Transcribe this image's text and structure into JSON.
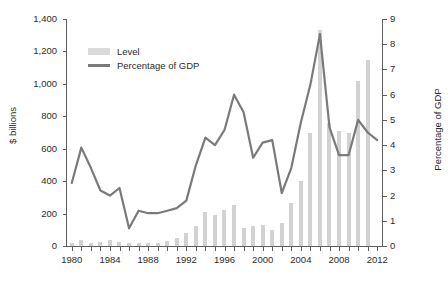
{
  "chart_data": {
    "type": "bar",
    "title": "",
    "subtitle": "",
    "xlabel": "",
    "ylabel": "$ billions",
    "y2label": "Percentage of GDP",
    "xlim": [
      1979.5,
      2012.5
    ],
    "ylim": [
      0,
      1400
    ],
    "y2lim": [
      0,
      9
    ],
    "grid": false,
    "legend_position": "upper-left",
    "x_tick_labels": [
      "1980",
      "1984",
      "1988",
      "1992",
      "1996",
      "2000",
      "2004",
      "2008",
      "2012"
    ],
    "x_tick_values": [
      1980,
      1984,
      1988,
      1992,
      1996,
      2000,
      2004,
      2008,
      2012
    ],
    "x_minor_tick_step": 1,
    "y_tick_labels": [
      "0",
      "200",
      "400",
      "600",
      "800",
      "1,000",
      "1,200",
      "1,400"
    ],
    "y_tick_values": [
      0,
      200,
      400,
      600,
      800,
      1000,
      1200,
      1400
    ],
    "y2_tick_labels": [
      "0",
      "1",
      "2",
      "3",
      "4",
      "5",
      "6",
      "7",
      "8",
      "9"
    ],
    "y2_tick_values": [
      0,
      1,
      2,
      3,
      4,
      5,
      6,
      7,
      8,
      9
    ],
    "categories": [
      1980,
      1981,
      1982,
      1983,
      1984,
      1985,
      1986,
      1987,
      1988,
      1989,
      1990,
      1991,
      1992,
      1993,
      1994,
      1995,
      1996,
      1997,
      1998,
      1999,
      2000,
      2001,
      2002,
      2003,
      2004,
      2005,
      2006,
      2007,
      2008,
      2009,
      2010,
      2011,
      2012
    ],
    "series": [
      {
        "name": "Level",
        "type": "bar",
        "axis": "left",
        "unit": "$ billions",
        "color": "#d2d2d2",
        "values": [
          20,
          35,
          20,
          22,
          40,
          25,
          18,
          20,
          18,
          20,
          30,
          50,
          80,
          125,
          210,
          190,
          225,
          255,
          110,
          125,
          130,
          100,
          145,
          265,
          400,
          700,
          1330,
          760,
          710,
          700,
          1020,
          1150,
          0
        ]
      },
      {
        "name": "Percentage of GDP",
        "type": "line",
        "axis": "right",
        "unit": "percent of GDP",
        "color": "#7a7a7a",
        "values": [
          2.5,
          3.9,
          3.1,
          2.2,
          2.0,
          2.3,
          0.7,
          1.4,
          1.3,
          1.3,
          1.4,
          1.5,
          1.8,
          3.2,
          4.3,
          4.0,
          4.6,
          6.0,
          5.3,
          3.5,
          4.1,
          4.2,
          2.1,
          3.1,
          4.9,
          6.4,
          8.4,
          4.7,
          3.6,
          3.6,
          5.0,
          4.5,
          4.2
        ]
      }
    ]
  },
  "legend": {
    "items": [
      {
        "label": "Level",
        "marker": "bar-swatch"
      },
      {
        "label": "Percentage of GDP",
        "marker": "line-swatch"
      }
    ]
  },
  "colors": {
    "bar": "#d2d2d2",
    "line": "#7a7a7a",
    "axis": "#5e5e5e",
    "text": "#2b2b2b",
    "background": "#ffffff"
  }
}
